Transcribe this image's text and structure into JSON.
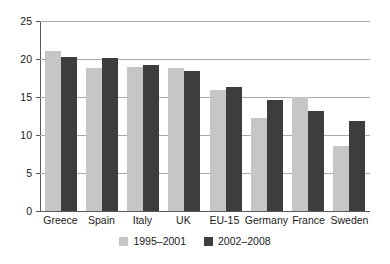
{
  "chart_data": {
    "type": "bar",
    "title": "",
    "subtitle": "",
    "xlabel": "",
    "ylabel": "",
    "ylim": [
      0,
      25
    ],
    "yticks": [
      0,
      5,
      10,
      15,
      20,
      25
    ],
    "ytick_labels": [
      "0",
      "5",
      "10",
      "15",
      "20",
      "25"
    ],
    "grid": true,
    "legend_position": "bottom-center",
    "categories": [
      "Greece",
      "Spain",
      "Italy",
      "UK",
      "EU-15",
      "Germany",
      "France",
      "Sweden"
    ],
    "series": [
      {
        "name": "1995–2001",
        "color": "#c6c6c6",
        "values": [
          21.0,
          18.8,
          19.0,
          18.8,
          15.9,
          12.2,
          15.0,
          8.5
        ]
      },
      {
        "name": "2002–2008",
        "color": "#3d3d3d",
        "values": [
          20.2,
          20.1,
          19.2,
          18.4,
          16.3,
          14.6,
          13.1,
          11.8
        ]
      }
    ]
  },
  "axis": {
    "axis_color": "#5a5a5a",
    "grid_color": "#a9a9a9"
  }
}
